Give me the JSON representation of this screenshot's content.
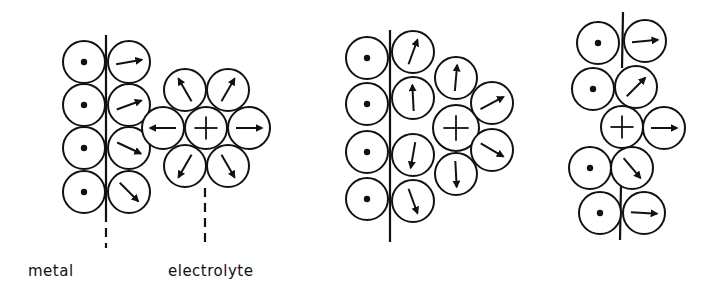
{
  "labels": {
    "metal": "metal",
    "electrolyte": "electrolyte"
  },
  "style": {
    "stroke": "#111111",
    "background": "#ffffff"
  },
  "legend": {
    "dot": "metal atom",
    "plus": "cation",
    "arrow": "solvent dipole orientation"
  },
  "panels": [
    {
      "id": "panel-1",
      "description": "Metal surface with adsorbed dipoles; solvated cation in electrolyte",
      "interface_line": {
        "x": 106,
        "y1": 35,
        "y2": 222,
        "dashed_y1": 228,
        "dashed_y2": 248
      },
      "extra_dashed_line": {
        "x": 205,
        "y1": 188,
        "y2": 248
      },
      "circles": [
        {
          "x": 84,
          "y": 62,
          "r": 21,
          "type": "dot"
        },
        {
          "x": 84,
          "y": 105,
          "r": 21,
          "type": "dot"
        },
        {
          "x": 84,
          "y": 148,
          "r": 21,
          "type": "dot"
        },
        {
          "x": 84,
          "y": 192,
          "r": 21,
          "type": "dot"
        },
        {
          "x": 129,
          "y": 62,
          "r": 21,
          "type": "arrow",
          "angle": -10
        },
        {
          "x": 129,
          "y": 105,
          "r": 21,
          "type": "arrow",
          "angle": -20
        },
        {
          "x": 129,
          "y": 148,
          "r": 21,
          "type": "arrow",
          "angle": 25
        },
        {
          "x": 129,
          "y": 192,
          "r": 21,
          "type": "arrow",
          "angle": 45
        },
        {
          "x": 206,
          "y": 128,
          "r": 21,
          "type": "plus"
        },
        {
          "x": 163,
          "y": 128,
          "r": 21,
          "type": "arrow",
          "angle": 180
        },
        {
          "x": 249,
          "y": 128,
          "r": 21,
          "type": "arrow",
          "angle": 0
        },
        {
          "x": 185,
          "y": 90,
          "r": 21,
          "type": "arrow",
          "angle": -120
        },
        {
          "x": 228,
          "y": 90,
          "r": 21,
          "type": "arrow",
          "angle": -60
        },
        {
          "x": 185,
          "y": 166,
          "r": 21,
          "type": "arrow",
          "angle": 120
        },
        {
          "x": 228,
          "y": 166,
          "r": 21,
          "type": "arrow",
          "angle": 60
        }
      ]
    },
    {
      "id": "panel-2",
      "description": "Partially solvated cation approaching metal surface",
      "interface_line": {
        "x": 390,
        "y1": 30,
        "y2": 242
      },
      "circles": [
        {
          "x": 367,
          "y": 58,
          "r": 21,
          "type": "dot"
        },
        {
          "x": 367,
          "y": 104,
          "r": 21,
          "type": "dot"
        },
        {
          "x": 367,
          "y": 152,
          "r": 21,
          "type": "dot"
        },
        {
          "x": 367,
          "y": 199,
          "r": 21,
          "type": "dot"
        },
        {
          "x": 413,
          "y": 52,
          "r": 21,
          "type": "arrow",
          "angle": -70
        },
        {
          "x": 413,
          "y": 98,
          "r": 21,
          "type": "arrow",
          "angle": -93
        },
        {
          "x": 413,
          "y": 155,
          "r": 21,
          "type": "arrow",
          "angle": 100
        },
        {
          "x": 413,
          "y": 201,
          "r": 21,
          "type": "arrow",
          "angle": 70
        },
        {
          "x": 456,
          "y": 78,
          "r": 21,
          "type": "arrow",
          "angle": -85
        },
        {
          "x": 456,
          "y": 128,
          "r": 23,
          "type": "plus"
        },
        {
          "x": 456,
          "y": 174,
          "r": 21,
          "type": "arrow",
          "angle": 87
        },
        {
          "x": 492,
          "y": 103,
          "r": 21,
          "type": "arrow",
          "angle": -28
        },
        {
          "x": 492,
          "y": 150,
          "r": 21,
          "type": "arrow",
          "angle": 30
        }
      ]
    },
    {
      "id": "panel-3",
      "description": "Specifically adsorbed cation inside the metal surface layer",
      "interface_line_top": {
        "x1": 623,
        "y1": 12,
        "x2": 622,
        "y2": 68
      },
      "interface_line_bottom": {
        "x1": 621,
        "y1": 185,
        "x2": 620,
        "y2": 240
      },
      "circles": [
        {
          "x": 598,
          "y": 43,
          "r": 21,
          "type": "dot"
        },
        {
          "x": 645,
          "y": 41,
          "r": 21,
          "type": "arrow",
          "angle": -5
        },
        {
          "x": 593,
          "y": 89,
          "r": 21,
          "type": "dot"
        },
        {
          "x": 636,
          "y": 87,
          "r": 21,
          "type": "arrow",
          "angle": -45
        },
        {
          "x": 622,
          "y": 127,
          "r": 21,
          "type": "plus"
        },
        {
          "x": 664,
          "y": 128,
          "r": 21,
          "type": "arrow",
          "angle": 0
        },
        {
          "x": 590,
          "y": 168,
          "r": 21,
          "type": "dot"
        },
        {
          "x": 632,
          "y": 168,
          "r": 21,
          "type": "arrow",
          "angle": 50
        },
        {
          "x": 600,
          "y": 213,
          "r": 21,
          "type": "dot"
        },
        {
          "x": 644,
          "y": 213,
          "r": 21,
          "type": "arrow",
          "angle": 3
        }
      ]
    }
  ]
}
